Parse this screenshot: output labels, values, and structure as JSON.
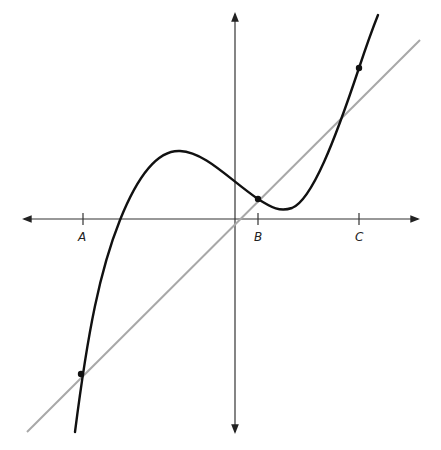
{
  "diagram": {
    "type": "function-graph",
    "axis_color": "#222222",
    "curve_color": "#111111",
    "line_color": "#a8a8a8",
    "labels": {
      "A": "A",
      "B": "B",
      "C": "C"
    },
    "intersection_points": [
      {
        "label": "A",
        "px": [
          75,
          374
        ]
      },
      {
        "label": "B",
        "px": [
          258,
          199
        ]
      },
      {
        "label": "C",
        "px": [
          359,
          68
        ]
      }
    ]
  }
}
